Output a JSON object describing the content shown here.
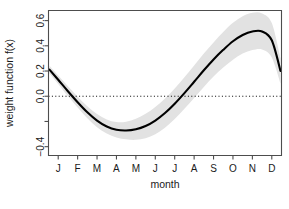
{
  "chart_data": {
    "type": "line",
    "title": "",
    "subtitle": "",
    "xlabel": "month",
    "ylabel": "weight function f(x)",
    "xlim": [
      0.5,
      12.5
    ],
    "ylim": [
      -0.47,
      0.68
    ],
    "grid": false,
    "legend": null,
    "box": true,
    "x_tick_labels": [
      "J",
      "F",
      "M",
      "A",
      "M",
      "J",
      "J",
      "A",
      "S",
      "O",
      "N",
      "D"
    ],
    "x_tick_values": [
      1,
      2,
      3,
      4,
      5,
      6,
      7,
      8,
      9,
      10,
      11,
      12
    ],
    "y_tick_labels": [
      "0.6",
      "0.4",
      "0.2",
      "0.0",
      "",
      "-0.4"
    ],
    "y_tick_values": [
      0.6,
      0.4,
      0.2,
      0.0,
      -0.2,
      -0.4
    ],
    "reference_line": {
      "y": 0.0,
      "style": "dotted",
      "color": "#000000"
    },
    "band_color": "#e2e2e2",
    "line_color": "#000000",
    "axis_color": "#4d4d4d",
    "series": [
      {
        "name": "fit",
        "x": [
          0.55,
          1.0,
          1.5,
          2.0,
          2.5,
          3.0,
          3.5,
          4.0,
          4.5,
          5.0,
          5.5,
          6.0,
          6.5,
          7.0,
          7.5,
          8.0,
          8.5,
          9.0,
          9.5,
          10.0,
          10.5,
          11.0,
          11.5,
          12.0,
          12.45
        ],
        "values": [
          0.211,
          0.131,
          0.04,
          -0.047,
          -0.127,
          -0.193,
          -0.24,
          -0.266,
          -0.272,
          -0.262,
          -0.236,
          -0.193,
          -0.133,
          -0.059,
          0.025,
          0.115,
          0.206,
          0.292,
          0.368,
          0.436,
          0.486,
          0.514,
          0.514,
          0.444,
          0.2
        ]
      },
      {
        "name": "upper_ci",
        "x": [
          0.55,
          1.0,
          1.5,
          2.0,
          2.5,
          3.0,
          3.5,
          4.0,
          4.5,
          5.0,
          5.5,
          6.0,
          6.5,
          7.0,
          7.5,
          8.0,
          8.5,
          9.0,
          9.5,
          10.0,
          10.5,
          11.0,
          11.5,
          12.0,
          12.45
        ],
        "values": [
          0.241,
          0.164,
          0.079,
          -0.004,
          -0.079,
          -0.141,
          -0.184,
          -0.205,
          -0.202,
          -0.178,
          -0.139,
          -0.085,
          -0.017,
          0.062,
          0.15,
          0.244,
          0.338,
          0.427,
          0.509,
          0.582,
          0.634,
          0.662,
          0.657,
          0.58,
          0.3
        ]
      },
      {
        "name": "lower_ci",
        "x": [
          0.55,
          1.0,
          1.5,
          2.0,
          2.5,
          3.0,
          3.5,
          4.0,
          4.5,
          5.0,
          5.5,
          6.0,
          6.5,
          7.0,
          7.5,
          8.0,
          8.5,
          9.0,
          9.5,
          10.0,
          10.5,
          11.0,
          11.5,
          12.0,
          12.45
        ],
        "values": [
          0.181,
          0.098,
          0.001,
          -0.09,
          -0.175,
          -0.245,
          -0.296,
          -0.327,
          -0.342,
          -0.346,
          -0.333,
          -0.301,
          -0.249,
          -0.18,
          -0.1,
          -0.014,
          0.074,
          0.157,
          0.227,
          0.29,
          0.338,
          0.366,
          0.371,
          0.308,
          0.1
        ]
      }
    ],
    "annotations": [
      {
        "text": "zero reference line at f(x) = 0.0"
      }
    ]
  }
}
